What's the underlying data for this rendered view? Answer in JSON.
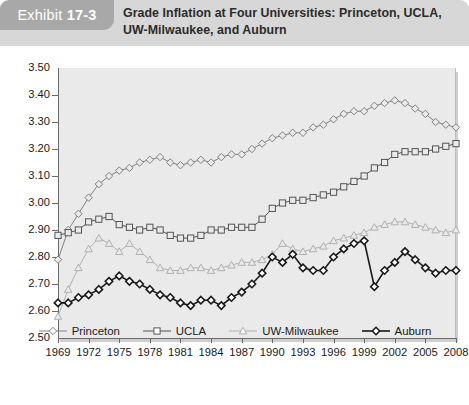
{
  "header": {
    "badge_word": "Exhibit",
    "badge_number": "17-3",
    "title": "Grade Inflation at Four Universities: Princeton, UCLA, UW-Milwaukee, and Auburn",
    "badge_bg": "#a8a8a8",
    "header_bg": "#d7d7d7"
  },
  "chart_data": {
    "type": "line",
    "title": "Grade Inflation at Four Universities: Princeton, UCLA, UW-Milwaukee, and Auburn",
    "xlabel": "",
    "ylabel": "",
    "ylim": [
      2.5,
      3.5
    ],
    "ytick_step": 0.1,
    "ytick_labels": [
      "3.50",
      "3.40",
      "3.30",
      "3.20",
      "3.10",
      "3.00",
      "2.90",
      "2.80",
      "2.70",
      "2.60",
      "2.50"
    ],
    "xlim": [
      1969,
      2008
    ],
    "xtick_labels": [
      "1969",
      "1972",
      "1975",
      "1978",
      "1981",
      "1984",
      "1987",
      "1990",
      "1993",
      "1996",
      "1999",
      "2002",
      "2005",
      "2008"
    ],
    "xtick_values": [
      1969,
      1972,
      1975,
      1978,
      1981,
      1984,
      1987,
      1990,
      1993,
      1996,
      1999,
      2002,
      2005,
      2008
    ],
    "grid": false,
    "legend_position": "bottom",
    "plot_background": "#eaeaea",
    "x": [
      1969,
      1970,
      1971,
      1972,
      1973,
      1974,
      1975,
      1976,
      1977,
      1978,
      1979,
      1980,
      1981,
      1982,
      1983,
      1984,
      1985,
      1986,
      1987,
      1988,
      1989,
      1990,
      1991,
      1992,
      1993,
      1994,
      1995,
      1996,
      1997,
      1998,
      1999,
      2000,
      2001,
      2002,
      2003,
      2004,
      2005,
      2006,
      2007,
      2008
    ],
    "series": [
      {
        "name": "Princeton",
        "marker": "diamond-open",
        "color": "#808080",
        "values": [
          2.79,
          2.9,
          2.96,
          3.02,
          3.07,
          3.1,
          3.12,
          3.13,
          3.15,
          3.16,
          3.17,
          3.15,
          3.14,
          3.15,
          3.16,
          3.15,
          3.17,
          3.18,
          3.18,
          3.2,
          3.22,
          3.24,
          3.25,
          3.26,
          3.26,
          3.28,
          3.29,
          3.31,
          3.33,
          3.34,
          3.34,
          3.36,
          3.37,
          3.38,
          3.37,
          3.35,
          3.33,
          3.3,
          3.29,
          3.28
        ]
      },
      {
        "name": "UCLA",
        "marker": "square-open",
        "color": "#555555",
        "values": [
          2.88,
          2.89,
          2.9,
          2.93,
          2.94,
          2.95,
          2.92,
          2.91,
          2.9,
          2.91,
          2.9,
          2.88,
          2.87,
          2.87,
          2.88,
          2.9,
          2.9,
          2.91,
          2.91,
          2.91,
          2.94,
          2.98,
          3.0,
          3.01,
          3.01,
          3.02,
          3.03,
          3.04,
          3.06,
          3.08,
          3.1,
          3.13,
          3.15,
          3.18,
          3.19,
          3.19,
          3.19,
          3.2,
          3.21,
          3.22
        ]
      },
      {
        "name": "UW-Milwaukee",
        "marker": "triangle-open",
        "color": "#b0b0b0",
        "values": [
          2.58,
          2.68,
          2.76,
          2.83,
          2.87,
          2.85,
          2.82,
          2.85,
          2.82,
          2.79,
          2.76,
          2.75,
          2.75,
          2.76,
          2.76,
          2.75,
          2.76,
          2.77,
          2.78,
          2.78,
          2.79,
          2.81,
          2.85,
          2.83,
          2.82,
          2.83,
          2.84,
          2.86,
          2.87,
          2.88,
          2.89,
          2.91,
          2.92,
          2.93,
          2.93,
          2.92,
          2.91,
          2.9,
          2.89,
          2.9
        ]
      },
      {
        "name": "Auburn",
        "marker": "diamond-filled",
        "color": "#1a1a1a",
        "values": [
          2.63,
          2.63,
          2.65,
          2.66,
          2.68,
          2.71,
          2.73,
          2.71,
          2.7,
          2.68,
          2.66,
          2.65,
          2.63,
          2.62,
          2.64,
          2.64,
          2.62,
          2.65,
          2.67,
          2.7,
          2.74,
          2.8,
          2.78,
          2.81,
          2.76,
          2.75,
          2.75,
          2.8,
          2.83,
          2.85,
          2.86,
          2.69,
          2.75,
          2.78,
          2.82,
          2.79,
          2.76,
          2.74,
          2.75,
          2.75
        ]
      }
    ]
  },
  "legend": {
    "items": [
      {
        "label": "Princeton",
        "marker": "diamond-open",
        "color": "#808080"
      },
      {
        "label": "UCLA",
        "marker": "square-open",
        "color": "#555555"
      },
      {
        "label": "UW-Milwaukee",
        "marker": "triangle-open",
        "color": "#b0b0b0"
      },
      {
        "label": "Auburn",
        "marker": "diamond-filled",
        "color": "#1a1a1a"
      }
    ]
  }
}
